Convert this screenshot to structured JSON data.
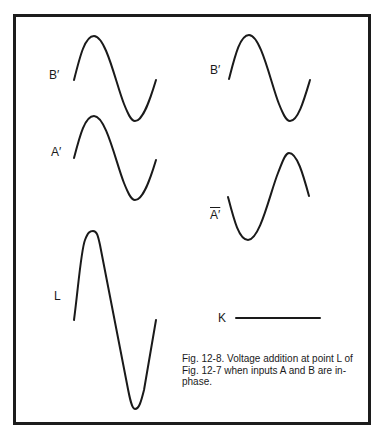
{
  "figure": {
    "caption": "Fig. 12-8. Voltage addition at point L of Fig. 12-7 when inputs A and B are in-phase.",
    "border_color": "#1c1c1c",
    "stroke_color": "#1a1a1a"
  },
  "labels": {
    "left_b_prime": "B′",
    "left_a_prime": "A′",
    "left_l": "L",
    "right_b_prime": "B′",
    "right_a_bar_prime": "A′",
    "right_k": "K"
  },
  "waveforms": [
    {
      "id": "left-b-prime",
      "label": "B′",
      "type": "sine",
      "phase": "in-phase",
      "amplitude": 1
    },
    {
      "id": "left-a-prime",
      "label": "A′",
      "type": "sine",
      "phase": "in-phase",
      "amplitude": 1
    },
    {
      "id": "left-l",
      "label": "L",
      "type": "sine",
      "phase": "in-phase",
      "amplitude": 2
    },
    {
      "id": "right-b-prime",
      "label": "B′",
      "type": "sine",
      "phase": "in-phase",
      "amplitude": 1
    },
    {
      "id": "right-a-bar-prime",
      "label": "A′ (inverted)",
      "type": "sine",
      "phase": "inverted",
      "amplitude": 1
    },
    {
      "id": "right-k",
      "label": "K",
      "type": "flat",
      "amplitude": 0
    }
  ]
}
